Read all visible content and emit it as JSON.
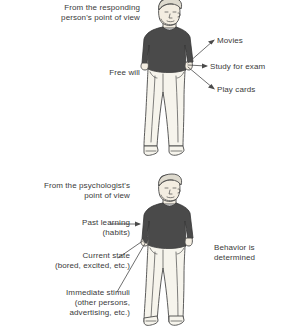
{
  "diagram": {
    "background_color": "#ffffff",
    "text_color": "#3a3a3a",
    "line_color": "#4a4a4a",
    "sweater_color": "#4a4a4a",
    "pants_color": "#f4f2ea",
    "skin_color": "#f2ece0",
    "hair_color": "#ded9cd"
  },
  "panels": [
    {
      "id": "responding-person",
      "heading": "From the responding\nperson's point of view",
      "concept": "Free will",
      "person_icon": "standing-person-icon",
      "outcomes": [
        {
          "label": "Movies"
        },
        {
          "label": "Study for exam"
        },
        {
          "label": "Play cards"
        }
      ]
    },
    {
      "id": "psychologist",
      "heading": "From the psychologist's\npoint of view",
      "concept": "Behavior is\ndetermined",
      "person_icon": "standing-person-icon",
      "causes": [
        {
          "label": "Past learning\n(habits)"
        },
        {
          "label": "Current state\n(bored, excited, etc.)"
        },
        {
          "label": "Immediate stimuli\n(other persons,\nadvertising, etc.)"
        }
      ]
    }
  ]
}
